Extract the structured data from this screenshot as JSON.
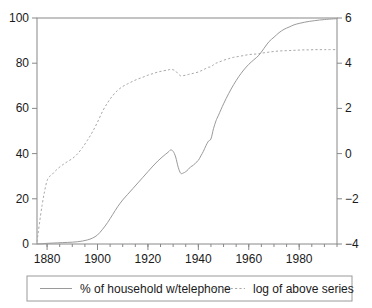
{
  "chart_data": {
    "type": "line",
    "title": "",
    "xlabel": "",
    "ylabel": "",
    "grid": false,
    "legend_position": "bottom",
    "xlim": [
      1876,
      1995
    ],
    "xticks": [
      1880,
      1900,
      1920,
      1940,
      1960,
      1980
    ],
    "xtick_labels": [
      "1880",
      "1900",
      "1920",
      "1940",
      "1960",
      "1980"
    ],
    "xminor_step": 5,
    "left_axis": {
      "label": "",
      "ylim": [
        0,
        100
      ],
      "yticks": [
        0,
        20,
        40,
        60,
        80,
        100
      ],
      "ytick_labels": [
        "0",
        "20",
        "40",
        "60",
        "80",
        "100"
      ]
    },
    "right_axis": {
      "label": "",
      "ylim": [
        -4,
        6
      ],
      "yticks": [
        -4,
        -2,
        0,
        2,
        4,
        6
      ],
      "ytick_labels": [
        "−4",
        "−2",
        "0",
        "2",
        "4",
        "6"
      ]
    },
    "series": [
      {
        "name": "% of household w/telephone",
        "style": "solid",
        "color": "#9a9a9a",
        "axis": "left",
        "x": [
          1876,
          1878,
          1880,
          1882,
          1884,
          1886,
          1888,
          1890,
          1892,
          1894,
          1896,
          1898,
          1900,
          1902,
          1904,
          1906,
          1908,
          1910,
          1912,
          1914,
          1916,
          1918,
          1920,
          1922,
          1924,
          1926,
          1928,
          1929,
          1930,
          1931,
          1932,
          1933,
          1934,
          1935,
          1936,
          1937,
          1938,
          1939,
          1940,
          1941,
          1942,
          1943,
          1944,
          1945,
          1946,
          1947,
          1948,
          1950,
          1952,
          1954,
          1956,
          1958,
          1960,
          1962,
          1964,
          1966,
          1968,
          1970,
          1972,
          1974,
          1976,
          1978,
          1980,
          1982,
          1984,
          1986,
          1988,
          1990,
          1992,
          1995
        ],
        "y": [
          0.02,
          0.1,
          0.3,
          0.4,
          0.5,
          0.6,
          0.7,
          0.8,
          1.0,
          1.3,
          1.8,
          2.6,
          4.0,
          6.5,
          9.5,
          13.0,
          16.5,
          19.5,
          22.0,
          24.5,
          27.0,
          29.5,
          32.0,
          34.5,
          36.8,
          38.8,
          40.6,
          41.6,
          41.0,
          38.5,
          34.0,
          31.3,
          31.4,
          32.0,
          33.0,
          34.2,
          34.8,
          36.0,
          37.0,
          39.0,
          41.0,
          43.5,
          45.5,
          46.5,
          51.0,
          54.5,
          57.0,
          62.0,
          66.5,
          70.5,
          74.0,
          77.0,
          79.5,
          81.5,
          83.5,
          86.5,
          89.5,
          91.5,
          93.5,
          95.0,
          96.0,
          97.0,
          97.6,
          98.1,
          98.5,
          98.8,
          99.1,
          99.3,
          99.5,
          99.7
        ]
      },
      {
        "name": "log of above series",
        "style": "dashed",
        "color": "#a8a8a8",
        "axis": "right",
        "x": [
          1876,
          1878,
          1880,
          1882,
          1884,
          1886,
          1888,
          1890,
          1892,
          1894,
          1896,
          1898,
          1900,
          1902,
          1904,
          1906,
          1908,
          1910,
          1912,
          1914,
          1916,
          1918,
          1920,
          1922,
          1924,
          1926,
          1928,
          1929,
          1930,
          1931,
          1932,
          1933,
          1934,
          1935,
          1936,
          1937,
          1938,
          1939,
          1940,
          1941,
          1942,
          1943,
          1944,
          1945,
          1946,
          1947,
          1948,
          1950,
          1952,
          1954,
          1956,
          1958,
          1960,
          1962,
          1964,
          1966,
          1968,
          1970,
          1972,
          1974,
          1976,
          1978,
          1980,
          1982,
          1984,
          1986,
          1988,
          1990,
          1992,
          1995
        ],
        "y": [
          -3.9,
          -2.3,
          -1.2,
          -0.92,
          -0.69,
          -0.51,
          -0.36,
          -0.22,
          -0.02,
          0.26,
          0.59,
          0.96,
          1.39,
          1.87,
          2.25,
          2.56,
          2.8,
          2.97,
          3.09,
          3.2,
          3.3,
          3.38,
          3.47,
          3.54,
          3.61,
          3.66,
          3.7,
          3.73,
          3.71,
          3.65,
          3.53,
          3.44,
          3.45,
          3.47,
          3.5,
          3.53,
          3.55,
          3.58,
          3.61,
          3.66,
          3.71,
          3.77,
          3.82,
          3.84,
          3.93,
          4.0,
          4.04,
          4.13,
          4.2,
          4.26,
          4.3,
          4.34,
          4.38,
          4.4,
          4.42,
          4.46,
          4.49,
          4.52,
          4.54,
          4.55,
          4.56,
          4.57,
          4.58,
          4.59,
          4.59,
          4.6,
          4.6,
          4.6,
          4.6,
          4.6
        ]
      }
    ]
  },
  "legend": {
    "entries": [
      {
        "label": "% of household w/telephone",
        "style": "solid"
      },
      {
        "label": "log of above series",
        "style": "dashed"
      }
    ]
  }
}
